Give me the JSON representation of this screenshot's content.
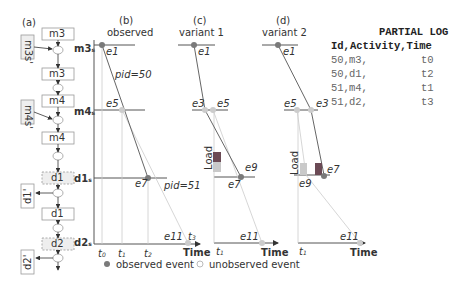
{
  "panels": {
    "a": {
      "label": "(a)"
    },
    "b": {
      "label": "(b)",
      "title": "observed"
    },
    "c": {
      "label": "(c)",
      "title": "variant 1"
    },
    "d": {
      "label": "(d)",
      "title": "variant 2"
    }
  },
  "process_model": {
    "boxes": [
      "m3s",
      "m3c",
      "m4s",
      "m4c",
      "d1s",
      "d1c",
      "d2s"
    ],
    "side_inputs": [
      "m3s'",
      "m4s'"
    ],
    "side_outputs": [
      "d1'",
      "d2'"
    ],
    "stage_labels": [
      "m3",
      "m4",
      "d1",
      "d2"
    ]
  },
  "axis": {
    "y_labels": [
      "m3",
      "m4",
      "d1",
      "d2"
    ],
    "y_subscript": "s",
    "x_label": "Time",
    "time_ticks": [
      "t0",
      "t1",
      "t2",
      "t3"
    ]
  },
  "events": {
    "observed": [
      "e1",
      "e5",
      "e7",
      "e11"
    ],
    "variant1": [
      "e1",
      "e3",
      "e5",
      "e7",
      "e9",
      "e11"
    ],
    "variant2": [
      "e1",
      "e5",
      "e3",
      "e7",
      "e9",
      "e11"
    ]
  },
  "annotations": {
    "pid50": "pid=50",
    "pid51": "pid=51",
    "load": "Load"
  },
  "legend": {
    "observed": "observed event",
    "unobserved": "unobserved event"
  },
  "partial_log": {
    "title": "PARTIAL LOG",
    "header": "Id,Activity,Time",
    "rows": [
      {
        "id": "50,",
        "activity": "m3,",
        "time": "t0"
      },
      {
        "id": "50,",
        "activity": "d1,",
        "time": "t2"
      },
      {
        "id": "51,",
        "activity": "m4,",
        "time": "t1"
      },
      {
        "id": "51,",
        "activity": "d2,",
        "time": "t3"
      }
    ]
  },
  "colors": {
    "observed": "#7a7a7a",
    "unobserved": "#cccccc",
    "load_dark": "#6b4a55",
    "load_light": "#c9c9c9",
    "line": "#555555"
  }
}
